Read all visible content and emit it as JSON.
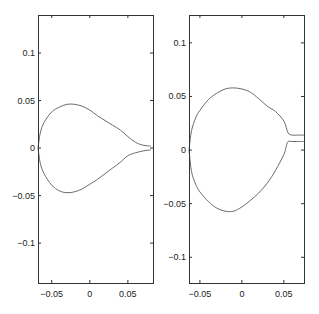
{
  "chart_data": [
    {
      "type": "line",
      "title": "",
      "xlabel": "",
      "ylabel": "",
      "xlim": [
        -0.068,
        0.083
      ],
      "ylim": [
        -0.142,
        0.14
      ],
      "grid": false,
      "x_ticks": [
        -0.05,
        0,
        0.05
      ],
      "x_tick_labels": [
        "-0.05",
        "0",
        "0.05"
      ],
      "y_ticks": [
        0.1,
        0.05,
        0,
        -0.05,
        -0.1
      ],
      "y_tick_labels": [
        "0.1",
        "0.05",
        "0",
        "-0.05",
        "-0.1"
      ],
      "series": [
        {
          "name": "upper contour",
          "x": [
            -0.068,
            -0.065,
            -0.06,
            -0.05,
            -0.04,
            -0.03,
            -0.02,
            -0.01,
            0.0,
            0.01,
            0.02,
            0.03,
            0.04,
            0.05,
            0.06,
            0.07,
            0.08
          ],
          "y": [
            0.0,
            0.016,
            0.027,
            0.038,
            0.043,
            0.046,
            0.046,
            0.044,
            0.04,
            0.034,
            0.029,
            0.024,
            0.019,
            0.012,
            0.006,
            0.003,
            0.002
          ]
        },
        {
          "name": "lower contour",
          "x": [
            -0.068,
            -0.065,
            -0.06,
            -0.05,
            -0.04,
            -0.03,
            -0.02,
            -0.01,
            0.0,
            0.01,
            0.02,
            0.03,
            0.04,
            0.05,
            0.06,
            0.07,
            0.08
          ],
          "y": [
            0.0,
            -0.016,
            -0.027,
            -0.039,
            -0.045,
            -0.047,
            -0.046,
            -0.043,
            -0.038,
            -0.033,
            -0.027,
            -0.021,
            -0.015,
            -0.008,
            -0.005,
            -0.003,
            -0.002
          ]
        }
      ]
    },
    {
      "type": "line",
      "title": "",
      "xlabel": "",
      "ylabel": "",
      "xlim": [
        -0.063,
        0.074
      ],
      "ylim": [
        -0.124,
        0.126
      ],
      "grid": false,
      "x_ticks": [
        -0.05,
        0,
        0.05
      ],
      "x_tick_labels": [
        "-0.05",
        "0",
        "0.05"
      ],
      "y_ticks": [
        0.1,
        0.05,
        0,
        -0.05,
        -0.1
      ],
      "y_tick_labels": [
        "0.1",
        "0.05",
        "0",
        "-0.05",
        "-0.1"
      ],
      "series": [
        {
          "name": "upper contour",
          "x": [
            -0.063,
            -0.06,
            -0.055,
            -0.05,
            -0.04,
            -0.03,
            -0.02,
            -0.01,
            0.0,
            0.01,
            0.02,
            0.03,
            0.04,
            0.05,
            0.055,
            0.06,
            0.065,
            0.07,
            0.074
          ],
          "y": [
            0.0,
            0.018,
            0.03,
            0.037,
            0.047,
            0.053,
            0.057,
            0.058,
            0.057,
            0.054,
            0.048,
            0.041,
            0.036,
            0.027,
            0.016,
            0.014,
            0.014,
            0.014,
            0.014
          ]
        },
        {
          "name": "lower contour",
          "x": [
            -0.063,
            -0.06,
            -0.055,
            -0.05,
            -0.04,
            -0.03,
            -0.02,
            -0.01,
            0.0,
            0.01,
            0.02,
            0.03,
            0.04,
            0.05,
            0.053,
            0.055,
            0.06,
            0.065,
            0.07,
            0.074
          ],
          "y": [
            0.0,
            -0.02,
            -0.032,
            -0.039,
            -0.048,
            -0.054,
            -0.057,
            -0.057,
            -0.053,
            -0.047,
            -0.04,
            -0.031,
            -0.019,
            -0.004,
            0.004,
            0.008,
            0.008,
            0.008,
            0.008,
            0.008
          ]
        }
      ]
    }
  ],
  "panels": [
    {
      "frame": {
        "x": 38,
        "y": 15,
        "w": 115,
        "h": 268
      },
      "x_tick_px": [
        52,
        90,
        128
      ],
      "y_tick_px": [
        53,
        101,
        149,
        196,
        243
      ]
    },
    {
      "frame": {
        "x": 189,
        "y": 15,
        "w": 115,
        "h": 268
      },
      "x_tick_px": [
        200,
        242,
        284
      ],
      "y_tick_px": [
        43,
        97,
        150,
        204,
        257
      ]
    }
  ]
}
